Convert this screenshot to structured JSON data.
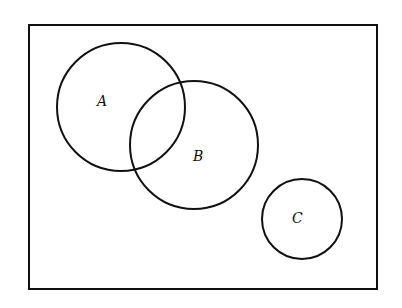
{
  "diagram": {
    "type": "venn",
    "universe": {
      "x": 28,
      "y": 24,
      "width": 349,
      "height": 265
    },
    "sets": [
      {
        "label": "A",
        "cx": 121,
        "cy": 107,
        "r": 64,
        "label_x": 104,
        "label_y": 106
      },
      {
        "label": "B",
        "cx": 194,
        "cy": 145,
        "r": 64,
        "label_x": 200,
        "label_y": 161
      },
      {
        "label": "C",
        "cx": 302,
        "cy": 219,
        "r": 40,
        "label_x": 298,
        "label_y": 223
      }
    ],
    "stroke_color": "#111111",
    "background": "#ffffff"
  }
}
